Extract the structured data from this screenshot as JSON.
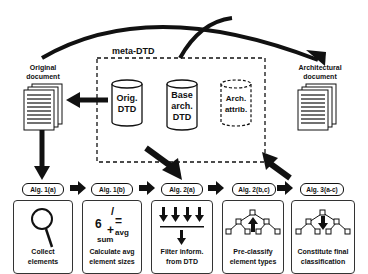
{
  "diagram": {
    "meta_dtd_label": "meta-DTD",
    "original_document": {
      "line1": "Original",
      "line2": "document"
    },
    "architectural_document": {
      "line1": "Architectural",
      "line2": "document"
    },
    "cylinders": [
      {
        "lines": [
          "Orig.",
          "DTD"
        ],
        "style": "solid"
      },
      {
        "lines": [
          "Base",
          "arch.",
          "DTD"
        ],
        "style": "solid"
      },
      {
        "lines": [
          "Arch.",
          "attrib."
        ],
        "style": "dashed"
      }
    ],
    "steps": [
      {
        "alg": "Alg. 1(a)",
        "caption": [
          "Collect",
          "elements"
        ],
        "icon": "magnifier-icon"
      },
      {
        "alg": "Alg. 1(b)",
        "caption": [
          "Calculate avg",
          "element sizes"
        ],
        "icon": "formula-icon",
        "formula": {
          "six": "6",
          "slash": "/",
          "plus": "+",
          "eq": "=",
          "sum": "sum",
          "avg": "avg"
        }
      },
      {
        "alg": "Alg. 2(a)",
        "caption": [
          "Filter inform.",
          "from DTD"
        ],
        "icon": "filter-arrows-icon"
      },
      {
        "alg": "Alg. 2(b,c)",
        "caption": [
          "Pre-classify",
          "element types"
        ],
        "icon": "tree-up-icon"
      },
      {
        "alg": "Alg. 3(a-c)",
        "caption": [
          "Constitute final",
          "classification"
        ],
        "icon": "tree-down-icon"
      }
    ],
    "colors": {
      "ink": "#111111",
      "background": "#ffffff"
    }
  }
}
